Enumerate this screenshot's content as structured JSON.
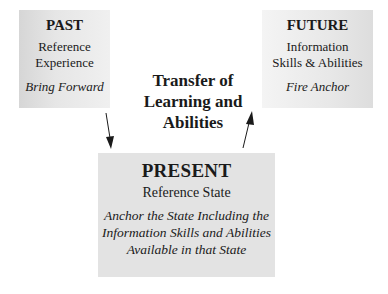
{
  "past": {
    "title": "PAST",
    "lines": [
      "Reference",
      "Experience"
    ],
    "action": "Bring Forward"
  },
  "future": {
    "title": "FUTURE",
    "lines": [
      "Information",
      "Skills & Abilities"
    ],
    "action": "Fire Anchor"
  },
  "present": {
    "title": "PRESENT",
    "subtitle": "Reference State",
    "action_lines": [
      "Anchor the State Including the",
      "Information Skills and Abilities",
      "Available in that State"
    ]
  },
  "center": {
    "lines": [
      "Transfer of",
      "Learning and",
      "Abilities"
    ]
  },
  "arrows": [
    {
      "from": "past",
      "to": "present",
      "direction": "down"
    },
    {
      "from": "present",
      "to": "future",
      "direction": "up"
    }
  ],
  "colors": {
    "box_fill": "#e3e3e3",
    "text": "#1a1a1a",
    "arrow": "#1a1a1a"
  }
}
